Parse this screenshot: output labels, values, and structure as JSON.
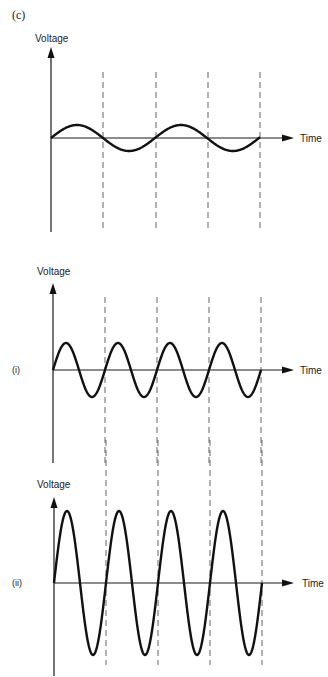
{
  "figure_label": "(c)",
  "colors": {
    "ink": "#111111",
    "dash": "#555555",
    "background": "#ffffff"
  },
  "panels": [
    {
      "id": "reference",
      "sublabel": "",
      "y_axis_label": "Voltage",
      "x_axis_label": "Time",
      "origin": {
        "x": 51,
        "y": 138
      },
      "y_axis_top": 47,
      "y_axis_bottom": 232,
      "x_axis_end": 294,
      "dashes": {
        "xs": [
          103,
          156,
          208,
          260
        ],
        "top": 72,
        "bottom": 232
      },
      "wave": {
        "amplitude": 13,
        "period": 104,
        "cycles": 2,
        "x_end": 260
      }
    },
    {
      "id": "higher-frequency",
      "sublabel": "(i)",
      "y_axis_label": "Voltage",
      "x_axis_label": "Time",
      "origin": {
        "x": 53,
        "y": 370
      },
      "y_axis_top": 283,
      "y_axis_bottom": 463,
      "x_axis_end": 294,
      "dashes": {
        "xs": [
          105,
          157,
          209,
          261
        ],
        "top": 297,
        "bottom": 463
      },
      "wave": {
        "amplitude": 27,
        "period": 52,
        "cycles": 4,
        "x_end": 261
      }
    },
    {
      "id": "higher-frequency-higher-amplitude",
      "sublabel": "(ii)",
      "y_axis_label": "Voltage",
      "x_axis_label": "Time",
      "origin": {
        "x": 54,
        "y": 583
      },
      "y_axis_top": 497,
      "y_axis_bottom": 676,
      "x_axis_end": 294,
      "dashes": {
        "xs": [
          106,
          158,
          210,
          262
        ],
        "top": 440,
        "bottom": 665
      },
      "wave": {
        "amplitude": 72,
        "period": 52,
        "cycles": 4,
        "x_end": 262
      }
    }
  ]
}
